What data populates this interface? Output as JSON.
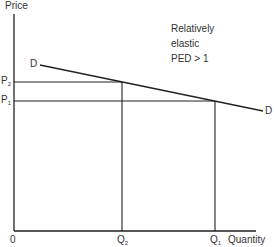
{
  "diagram": {
    "type": "demand-elasticity",
    "y_axis_label": "Price",
    "x_axis_label": "Quantity",
    "origin_label": "0",
    "curve_label_start": "D",
    "curve_label_end": "D",
    "annotation": [
      "Relatively",
      "elastic",
      "PED > 1"
    ],
    "price_levels": [
      {
        "base": "P",
        "sub": "2"
      },
      {
        "base": "P",
        "sub": "1"
      }
    ],
    "quantity_levels": [
      {
        "base": "Q",
        "sub": "2"
      },
      {
        "base": "Q",
        "sub": "1"
      }
    ],
    "colors": {
      "line": "#222222",
      "background": "#ffffff"
    }
  }
}
